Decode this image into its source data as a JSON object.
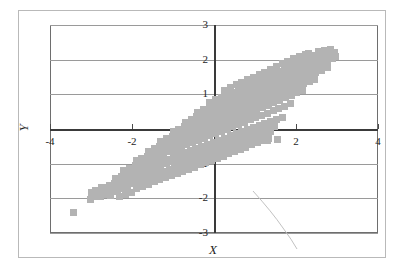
{
  "chart_data": {
    "type": "scatter",
    "title": "",
    "subtitle": "",
    "xlabel": "X",
    "ylabel": "Y",
    "xlim": [
      -4,
      4
    ],
    "ylim": [
      -3,
      3
    ],
    "grid": true,
    "legend": null,
    "legend_position": "none",
    "marker": {
      "shape": "square",
      "color": "#b3b3b3",
      "size_px": 7
    },
    "axis_style": {
      "zero_axes_drawn": true,
      "gridline_color": "#9a9a9a",
      "frame_color": "#6e6e6e",
      "tick_label_font_style": "serif",
      "axis_title_font_style": "italic-serif"
    },
    "xticks": [
      -4,
      -2,
      2,
      4
    ],
    "xtick_labels": [
      "-4",
      "-2",
      "2",
      "4"
    ],
    "yticks": [
      3,
      2,
      1,
      0,
      -1,
      -2,
      -3
    ],
    "ytick_labels": [
      "3",
      "2",
      "1",
      "0",
      "-1",
      "-2",
      "-3"
    ],
    "origin_label": "0",
    "annotations": [
      {
        "kind": "scan-artifact-curve",
        "note": "faint pen/scan arc in lower-right quadrant"
      }
    ],
    "outliers": [
      {
        "x": -3.42,
        "y": -2.42
      },
      {
        "x": -2.52,
        "y": -1.92
      }
    ],
    "points": [
      [
        -3.02,
        -2.04
      ],
      [
        -2.92,
        -1.96
      ],
      [
        -2.86,
        -1.88
      ],
      [
        -2.78,
        -1.94
      ],
      [
        -2.72,
        -1.84
      ],
      [
        -2.66,
        -1.9
      ],
      [
        -2.6,
        -1.8
      ],
      [
        -2.54,
        -1.74
      ],
      [
        -2.48,
        -1.8
      ],
      [
        -2.42,
        -1.7
      ],
      [
        -2.36,
        -1.76
      ],
      [
        -2.3,
        -1.66
      ],
      [
        -2.24,
        -1.72
      ],
      [
        -2.18,
        -1.62
      ],
      [
        -2.12,
        -1.68
      ],
      [
        -2.06,
        -1.58
      ],
      [
        -2.0,
        -1.5
      ],
      [
        -1.96,
        -1.58
      ],
      [
        -1.9,
        -1.46
      ],
      [
        -1.84,
        -1.54
      ],
      [
        -1.78,
        -1.42
      ],
      [
        -1.72,
        -1.5
      ],
      [
        -1.66,
        -1.38
      ],
      [
        -1.6,
        -1.46
      ],
      [
        -1.56,
        -1.34
      ],
      [
        -1.5,
        -1.42
      ],
      [
        -1.44,
        -1.3
      ],
      [
        -1.38,
        -1.38
      ],
      [
        -1.32,
        -1.26
      ],
      [
        -1.26,
        -1.34
      ],
      [
        -1.2,
        -1.22
      ],
      [
        -1.14,
        -1.3
      ],
      [
        -1.08,
        -1.18
      ],
      [
        -1.02,
        -1.26
      ],
      [
        -0.96,
        -1.12
      ],
      [
        -0.9,
        -1.2
      ],
      [
        -0.84,
        -1.06
      ],
      [
        -0.78,
        -1.14
      ],
      [
        -0.72,
        -1.0
      ],
      [
        -0.66,
        -1.08
      ],
      [
        -0.6,
        -0.94
      ],
      [
        -0.54,
        -1.02
      ],
      [
        -0.48,
        -0.88
      ],
      [
        -0.42,
        -0.96
      ],
      [
        -0.36,
        -0.82
      ],
      [
        -0.3,
        -0.9
      ],
      [
        -0.24,
        -0.76
      ],
      [
        -0.18,
        -0.84
      ],
      [
        -0.12,
        -0.7
      ],
      [
        -0.06,
        -0.78
      ],
      [
        0.0,
        -0.64
      ],
      [
        0.06,
        -0.72
      ],
      [
        0.12,
        -0.58
      ],
      [
        0.18,
        -0.66
      ],
      [
        0.24,
        -0.52
      ],
      [
        0.3,
        -0.6
      ],
      [
        0.36,
        -0.46
      ],
      [
        0.42,
        -0.54
      ],
      [
        0.48,
        -0.4
      ],
      [
        0.54,
        -0.48
      ],
      [
        0.6,
        -0.34
      ],
      [
        0.66,
        -0.42
      ],
      [
        0.72,
        -0.28
      ],
      [
        0.78,
        -0.36
      ],
      [
        0.84,
        -0.22
      ],
      [
        0.9,
        -0.3
      ],
      [
        0.96,
        -0.16
      ],
      [
        1.02,
        -0.24
      ],
      [
        1.08,
        -0.1
      ],
      [
        1.14,
        -0.18
      ],
      [
        1.2,
        -0.04
      ],
      [
        1.26,
        -0.12
      ],
      [
        1.32,
        0.02
      ],
      [
        1.38,
        -0.06
      ],
      [
        1.44,
        0.08
      ],
      [
        -2.7,
        -1.68
      ],
      [
        -2.56,
        -1.62
      ],
      [
        -2.42,
        -1.56
      ],
      [
        -2.28,
        -1.5
      ],
      [
        -2.14,
        -1.44
      ],
      [
        -2.0,
        -1.36
      ],
      [
        -1.86,
        -1.3
      ],
      [
        -1.72,
        -1.24
      ],
      [
        -1.58,
        -1.18
      ],
      [
        -1.44,
        -1.12
      ],
      [
        -1.3,
        -1.06
      ],
      [
        -1.16,
        -1.0
      ],
      [
        -1.02,
        -0.94
      ],
      [
        -0.88,
        -0.88
      ],
      [
        -0.74,
        -0.82
      ],
      [
        -0.6,
        -0.76
      ],
      [
        -0.46,
        -0.7
      ],
      [
        -0.32,
        -0.64
      ],
      [
        -0.18,
        -0.58
      ],
      [
        -0.04,
        -0.52
      ],
      [
        0.1,
        -0.46
      ],
      [
        0.24,
        -0.4
      ],
      [
        0.38,
        -0.34
      ],
      [
        0.52,
        -0.28
      ],
      [
        0.66,
        -0.22
      ],
      [
        0.8,
        -0.16
      ],
      [
        0.94,
        -0.1
      ],
      [
        1.08,
        -0.04
      ],
      [
        1.22,
        0.02
      ],
      [
        1.36,
        0.08
      ],
      [
        -2.4,
        -1.44
      ],
      [
        -2.26,
        -1.38
      ],
      [
        -2.12,
        -1.32
      ],
      [
        -1.98,
        -1.24
      ],
      [
        -1.84,
        -1.18
      ],
      [
        -1.7,
        -1.12
      ],
      [
        -1.56,
        -1.06
      ],
      [
        -1.42,
        -1.0
      ],
      [
        -1.28,
        -0.94
      ],
      [
        -1.14,
        -0.88
      ],
      [
        -1.0,
        -0.8
      ],
      [
        -0.86,
        -0.74
      ],
      [
        -0.72,
        -0.68
      ],
      [
        -0.58,
        -0.62
      ],
      [
        -0.44,
        -0.56
      ],
      [
        -0.3,
        -0.5
      ],
      [
        -0.16,
        -0.44
      ],
      [
        -0.02,
        -0.38
      ],
      [
        0.12,
        -0.32
      ],
      [
        0.26,
        -0.26
      ],
      [
        0.4,
        -0.2
      ],
      [
        0.54,
        -0.14
      ],
      [
        0.68,
        -0.08
      ],
      [
        0.82,
        -0.02
      ],
      [
        0.96,
        0.04
      ],
      [
        1.1,
        0.1
      ],
      [
        1.24,
        0.16
      ],
      [
        1.38,
        0.22
      ],
      [
        1.52,
        0.28
      ],
      [
        1.66,
        0.34
      ],
      [
        -2.2,
        -1.2
      ],
      [
        -2.06,
        -1.14
      ],
      [
        -1.92,
        -1.06
      ],
      [
        -1.78,
        -1.0
      ],
      [
        -1.64,
        -0.94
      ],
      [
        -1.5,
        -0.86
      ],
      [
        -1.36,
        -0.8
      ],
      [
        -1.22,
        -0.74
      ],
      [
        -1.08,
        -0.66
      ],
      [
        -0.94,
        -0.6
      ],
      [
        -0.8,
        -0.54
      ],
      [
        -0.66,
        -0.46
      ],
      [
        -0.52,
        -0.4
      ],
      [
        -0.38,
        -0.34
      ],
      [
        -0.24,
        -0.26
      ],
      [
        -0.1,
        -0.2
      ],
      [
        0.04,
        -0.14
      ],
      [
        0.18,
        -0.06
      ],
      [
        0.32,
        0.0
      ],
      [
        0.46,
        0.06
      ],
      [
        0.6,
        0.14
      ],
      [
        0.74,
        0.2
      ],
      [
        0.88,
        0.26
      ],
      [
        1.02,
        0.34
      ],
      [
        1.16,
        0.4
      ],
      [
        1.3,
        0.46
      ],
      [
        1.44,
        0.54
      ],
      [
        1.58,
        0.6
      ],
      [
        1.72,
        0.66
      ],
      [
        1.86,
        0.74
      ],
      [
        -1.9,
        -0.92
      ],
      [
        -1.76,
        -0.86
      ],
      [
        -1.62,
        -0.78
      ],
      [
        -1.48,
        -0.72
      ],
      [
        -1.34,
        -0.64
      ],
      [
        -1.2,
        -0.58
      ],
      [
        -1.06,
        -0.5
      ],
      [
        -0.92,
        -0.44
      ],
      [
        -0.78,
        -0.36
      ],
      [
        -0.64,
        -0.3
      ],
      [
        -0.5,
        -0.22
      ],
      [
        -0.36,
        -0.16
      ],
      [
        -0.22,
        -0.08
      ],
      [
        -0.08,
        -0.02
      ],
      [
        0.06,
        0.06
      ],
      [
        0.2,
        0.12
      ],
      [
        0.34,
        0.2
      ],
      [
        0.48,
        0.26
      ],
      [
        0.62,
        0.34
      ],
      [
        0.76,
        0.4
      ],
      [
        0.9,
        0.48
      ],
      [
        1.04,
        0.54
      ],
      [
        1.18,
        0.62
      ],
      [
        1.32,
        0.68
      ],
      [
        1.46,
        0.76
      ],
      [
        1.6,
        0.82
      ],
      [
        1.74,
        0.9
      ],
      [
        1.88,
        0.96
      ],
      [
        2.02,
        1.04
      ],
      [
        2.16,
        1.1
      ],
      [
        -1.6,
        -0.64
      ],
      [
        -1.46,
        -0.56
      ],
      [
        -1.32,
        -0.5
      ],
      [
        -1.18,
        -0.42
      ],
      [
        -1.04,
        -0.36
      ],
      [
        -0.9,
        -0.28
      ],
      [
        -0.76,
        -0.2
      ],
      [
        -0.62,
        -0.14
      ],
      [
        -0.48,
        -0.06
      ],
      [
        -0.34,
        0.0
      ],
      [
        -0.2,
        0.08
      ],
      [
        -0.06,
        0.16
      ],
      [
        0.08,
        0.22
      ],
      [
        0.22,
        0.3
      ],
      [
        0.36,
        0.36
      ],
      [
        0.5,
        0.44
      ],
      [
        0.64,
        0.52
      ],
      [
        0.78,
        0.58
      ],
      [
        0.92,
        0.66
      ],
      [
        1.06,
        0.72
      ],
      [
        1.2,
        0.8
      ],
      [
        1.34,
        0.88
      ],
      [
        1.48,
        0.94
      ],
      [
        1.62,
        1.02
      ],
      [
        1.76,
        1.08
      ],
      [
        1.9,
        1.16
      ],
      [
        2.04,
        1.24
      ],
      [
        2.18,
        1.3
      ],
      [
        2.32,
        1.38
      ],
      [
        2.46,
        1.44
      ],
      [
        -1.3,
        -0.36
      ],
      [
        -1.16,
        -0.28
      ],
      [
        -1.02,
        -0.22
      ],
      [
        -0.88,
        -0.14
      ],
      [
        -0.74,
        -0.06
      ],
      [
        -0.6,
        0.0
      ],
      [
        -0.46,
        0.08
      ],
      [
        -0.32,
        0.16
      ],
      [
        -0.18,
        0.22
      ],
      [
        -0.04,
        0.3
      ],
      [
        0.1,
        0.38
      ],
      [
        0.24,
        0.44
      ],
      [
        0.38,
        0.52
      ],
      [
        0.52,
        0.6
      ],
      [
        0.66,
        0.66
      ],
      [
        0.8,
        0.74
      ],
      [
        0.94,
        0.82
      ],
      [
        1.08,
        0.88
      ],
      [
        1.22,
        0.96
      ],
      [
        1.36,
        1.04
      ],
      [
        1.5,
        1.1
      ],
      [
        1.64,
        1.18
      ],
      [
        1.78,
        1.26
      ],
      [
        1.92,
        1.32
      ],
      [
        2.06,
        1.4
      ],
      [
        2.2,
        1.48
      ],
      [
        2.34,
        1.54
      ],
      [
        2.48,
        1.62
      ],
      [
        2.62,
        1.7
      ],
      [
        2.76,
        1.76
      ],
      [
        -1.0,
        -0.08
      ],
      [
        -0.86,
        0.0
      ],
      [
        -0.72,
        0.08
      ],
      [
        -0.58,
        0.14
      ],
      [
        -0.44,
        0.22
      ],
      [
        -0.3,
        0.3
      ],
      [
        -0.16,
        0.38
      ],
      [
        -0.02,
        0.44
      ],
      [
        0.12,
        0.52
      ],
      [
        0.26,
        0.6
      ],
      [
        0.4,
        0.68
      ],
      [
        0.54,
        0.74
      ],
      [
        0.68,
        0.82
      ],
      [
        0.82,
        0.9
      ],
      [
        0.96,
        0.98
      ],
      [
        1.1,
        1.04
      ],
      [
        1.24,
        1.12
      ],
      [
        1.38,
        1.2
      ],
      [
        1.52,
        1.28
      ],
      [
        1.66,
        1.34
      ],
      [
        1.8,
        1.42
      ],
      [
        1.94,
        1.5
      ],
      [
        2.08,
        1.58
      ],
      [
        2.22,
        1.64
      ],
      [
        2.36,
        1.72
      ],
      [
        2.5,
        1.8
      ],
      [
        2.64,
        1.88
      ],
      [
        2.78,
        1.94
      ],
      [
        2.9,
        2.02
      ],
      [
        2.96,
        2.1
      ],
      [
        -0.7,
        0.2
      ],
      [
        -0.56,
        0.28
      ],
      [
        -0.42,
        0.36
      ],
      [
        -0.28,
        0.44
      ],
      [
        -0.14,
        0.5
      ],
      [
        0.0,
        0.58
      ],
      [
        0.14,
        0.66
      ],
      [
        0.28,
        0.74
      ],
      [
        0.42,
        0.8
      ],
      [
        0.56,
        0.88
      ],
      [
        0.7,
        0.96
      ],
      [
        0.84,
        1.04
      ],
      [
        0.98,
        1.1
      ],
      [
        1.12,
        1.18
      ],
      [
        1.26,
        1.26
      ],
      [
        1.4,
        1.34
      ],
      [
        1.54,
        1.4
      ],
      [
        1.68,
        1.48
      ],
      [
        1.82,
        1.56
      ],
      [
        1.96,
        1.64
      ],
      [
        2.1,
        1.7
      ],
      [
        2.24,
        1.78
      ],
      [
        2.38,
        1.86
      ],
      [
        2.52,
        1.94
      ],
      [
        2.66,
        2.0
      ],
      [
        2.8,
        2.08
      ],
      [
        2.88,
        2.16
      ],
      [
        2.94,
        2.22
      ],
      [
        2.7,
        2.26
      ],
      [
        2.84,
        2.3
      ],
      [
        -0.4,
        0.48
      ],
      [
        -0.26,
        0.56
      ],
      [
        -0.12,
        0.64
      ],
      [
        0.02,
        0.72
      ],
      [
        0.16,
        0.8
      ],
      [
        0.3,
        0.86
      ],
      [
        0.44,
        0.94
      ],
      [
        0.58,
        1.02
      ],
      [
        0.72,
        1.1
      ],
      [
        0.86,
        1.16
      ],
      [
        1.0,
        1.24
      ],
      [
        1.14,
        1.32
      ],
      [
        1.28,
        1.4
      ],
      [
        1.42,
        1.46
      ],
      [
        1.56,
        1.54
      ],
      [
        1.7,
        1.62
      ],
      [
        1.84,
        1.7
      ],
      [
        1.98,
        1.76
      ],
      [
        2.12,
        1.84
      ],
      [
        2.26,
        1.92
      ],
      [
        2.4,
        2.0
      ],
      [
        2.54,
        2.06
      ],
      [
        2.68,
        2.14
      ],
      [
        2.82,
        2.22
      ],
      [
        2.56,
        2.24
      ],
      [
        -0.1,
        0.76
      ],
      [
        0.04,
        0.84
      ],
      [
        0.18,
        0.92
      ],
      [
        0.32,
        1.0
      ],
      [
        0.46,
        1.06
      ],
      [
        0.6,
        1.14
      ],
      [
        0.74,
        1.22
      ],
      [
        0.88,
        1.3
      ],
      [
        1.02,
        1.36
      ],
      [
        1.16,
        1.44
      ],
      [
        1.3,
        1.52
      ],
      [
        1.44,
        1.6
      ],
      [
        1.58,
        1.66
      ],
      [
        1.72,
        1.74
      ],
      [
        1.86,
        1.82
      ],
      [
        2.0,
        1.9
      ],
      [
        2.14,
        1.96
      ],
      [
        2.28,
        2.04
      ],
      [
        2.42,
        2.12
      ],
      [
        2.3,
        2.18
      ],
      [
        0.26,
        1.12
      ],
      [
        0.4,
        1.2
      ],
      [
        0.54,
        1.28
      ],
      [
        0.68,
        1.34
      ],
      [
        0.82,
        1.42
      ],
      [
        0.96,
        1.5
      ],
      [
        1.1,
        1.58
      ],
      [
        1.24,
        1.64
      ],
      [
        1.38,
        1.72
      ],
      [
        1.52,
        1.8
      ],
      [
        1.66,
        1.88
      ],
      [
        1.8,
        1.94
      ],
      [
        1.94,
        2.02
      ],
      [
        2.08,
        2.1
      ],
      [
        2.22,
        2.16
      ],
      [
        1.48,
        0.06
      ],
      [
        1.56,
        -0.3
      ],
      [
        1.3,
        -0.34
      ],
      [
        -2.3,
        -1.94
      ],
      [
        -2.16,
        -1.88
      ],
      [
        -2.02,
        -1.82
      ],
      [
        -1.88,
        -1.72
      ],
      [
        -1.74,
        -1.66
      ],
      [
        -1.6,
        -1.6
      ],
      [
        -1.46,
        -1.52
      ],
      [
        -1.32,
        -1.46
      ],
      [
        -1.18,
        -1.4
      ],
      [
        -1.04,
        -1.34
      ],
      [
        -0.9,
        -1.28
      ],
      [
        -0.76,
        -1.22
      ],
      [
        -0.62,
        -1.16
      ],
      [
        -0.48,
        -1.1
      ],
      [
        -0.34,
        -1.02
      ],
      [
        -0.2,
        -0.96
      ],
      [
        -0.06,
        -0.9
      ],
      [
        0.08,
        -0.84
      ],
      [
        0.22,
        -0.78
      ],
      [
        0.36,
        -0.7
      ],
      [
        0.5,
        -0.64
      ],
      [
        0.64,
        -0.58
      ],
      [
        0.78,
        -0.52
      ],
      [
        0.92,
        -0.44
      ],
      [
        1.06,
        -0.38
      ],
      [
        1.2,
        -0.32
      ],
      [
        1.34,
        -0.26
      ],
      [
        -2.88,
        -1.76
      ],
      [
        -2.74,
        -1.7
      ],
      [
        -2.62,
        -1.74
      ],
      [
        -3.0,
        -1.82
      ]
    ]
  }
}
